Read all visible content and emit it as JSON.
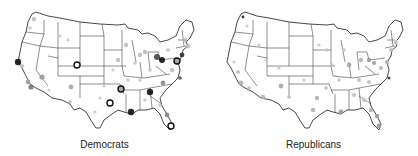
{
  "figure": {
    "panels": [
      {
        "label": "Democrats",
        "markers": [
          {
            "x": 34,
            "y": 19,
            "r": 2.2,
            "c": "#bdbdbd"
          },
          {
            "x": 30,
            "y": 28,
            "r": 1.8,
            "c": "#c8c8c8"
          },
          {
            "x": 18,
            "y": 62,
            "r": 3.2,
            "c": "#111111"
          },
          {
            "x": 22,
            "y": 66,
            "r": 2,
            "c": "#bdbdbd"
          },
          {
            "x": 28,
            "y": 82,
            "r": 2.4,
            "c": "#a0a0a0"
          },
          {
            "x": 31,
            "y": 87,
            "r": 2.6,
            "c": "#777777"
          },
          {
            "x": 42,
            "y": 77,
            "r": 2.6,
            "c": "#999999"
          },
          {
            "x": 49,
            "y": 90,
            "r": 1.6,
            "c": "#c8c8c8"
          },
          {
            "x": 60,
            "y": 36,
            "r": 1.6,
            "c": "#c8c8c8"
          },
          {
            "x": 68,
            "y": 40,
            "r": 1.6,
            "c": "#c8c8c8"
          },
          {
            "x": 77,
            "y": 65,
            "r": 3,
            "c": "ring"
          },
          {
            "x": 71,
            "y": 87,
            "r": 2.4,
            "c": "#a8a8a8"
          },
          {
            "x": 70,
            "y": 102,
            "r": 1.8,
            "c": "#bdbdbd"
          },
          {
            "x": 110,
            "y": 103,
            "r": 3,
            "c": "ring"
          },
          {
            "x": 100,
            "y": 98,
            "r": 1.6,
            "c": "#c8c8c8"
          },
          {
            "x": 121,
            "y": 89,
            "r": 3,
            "c": "ring-dark"
          },
          {
            "x": 131,
            "y": 112,
            "r": 3.2,
            "c": "#111111"
          },
          {
            "x": 150,
            "y": 92,
            "r": 3.2,
            "c": "#111111"
          },
          {
            "x": 163,
            "y": 83,
            "r": 2.4,
            "c": "#888888"
          },
          {
            "x": 167,
            "y": 115,
            "r": 2.4,
            "c": "#888888"
          },
          {
            "x": 171,
            "y": 126,
            "r": 3,
            "c": "ring"
          },
          {
            "x": 157,
            "y": 57,
            "r": 3,
            "c": "#444444"
          },
          {
            "x": 162,
            "y": 60,
            "r": 3,
            "c": "#111111"
          },
          {
            "x": 177,
            "y": 61,
            "r": 3,
            "c": "ring-dark"
          },
          {
            "x": 182,
            "y": 55,
            "r": 2.4,
            "c": "#333333"
          },
          {
            "x": 180,
            "y": 78,
            "r": 1.8,
            "c": "#555555"
          },
          {
            "x": 185,
            "y": 40,
            "r": 2.2,
            "c": "#bdbdbd"
          },
          {
            "x": 188,
            "y": 46,
            "r": 2.2,
            "c": "#bdbdbd"
          },
          {
            "x": 140,
            "y": 55,
            "r": 2.2,
            "c": "#bdbdbd"
          },
          {
            "x": 145,
            "y": 52,
            "r": 2.2,
            "c": "#bdbdbd"
          },
          {
            "x": 118,
            "y": 60,
            "r": 2.2,
            "c": "#bdbdbd"
          },
          {
            "x": 126,
            "y": 45,
            "r": 2.2,
            "c": "#bdbdbd"
          },
          {
            "x": 135,
            "y": 63,
            "r": 1.8,
            "c": "#c8c8c8"
          },
          {
            "x": 150,
            "y": 70,
            "r": 1.8,
            "c": "#c8c8c8"
          },
          {
            "x": 172,
            "y": 70,
            "r": 2.2,
            "c": "#bdbdbd"
          },
          {
            "x": 168,
            "y": 50,
            "r": 2,
            "c": "#c8c8c8"
          },
          {
            "x": 140,
            "y": 80,
            "r": 1.8,
            "c": "#c8c8c8"
          },
          {
            "x": 128,
            "y": 80,
            "r": 1.8,
            "c": "#c8c8c8"
          },
          {
            "x": 145,
            "y": 100,
            "r": 1.8,
            "c": "#c8c8c8"
          },
          {
            "x": 160,
            "y": 105,
            "r": 1.8,
            "c": "#c8c8c8"
          },
          {
            "x": 113,
            "y": 70,
            "r": 1.6,
            "c": "#c8c8c8"
          },
          {
            "x": 104,
            "y": 86,
            "r": 1.6,
            "c": "#c8c8c8"
          },
          {
            "x": 95,
            "y": 112,
            "r": 1.6,
            "c": "#c8c8c8"
          }
        ]
      },
      {
        "label": "Republicans",
        "markers": [
          {
            "x": 34,
            "y": 17,
            "r": 1.4,
            "c": "#222222"
          },
          {
            "x": 38,
            "y": 26,
            "r": 1.6,
            "c": "#c8c8c8"
          },
          {
            "x": 25,
            "y": 62,
            "r": 1.6,
            "c": "#c8c8c8"
          },
          {
            "x": 29,
            "y": 72,
            "r": 2,
            "c": "#bdbdbd"
          },
          {
            "x": 32,
            "y": 83,
            "r": 2.4,
            "c": "#b0b0b0"
          },
          {
            "x": 40,
            "y": 88,
            "r": 1.8,
            "c": "#bdbdbd"
          },
          {
            "x": 50,
            "y": 45,
            "r": 1.6,
            "c": "#c8c8c8"
          },
          {
            "x": 57,
            "y": 60,
            "r": 1.6,
            "c": "#c8c8c8"
          },
          {
            "x": 70,
            "y": 68,
            "r": 1.6,
            "c": "#c8c8c8"
          },
          {
            "x": 72,
            "y": 86,
            "r": 2.4,
            "c": "#a8a8a8"
          },
          {
            "x": 54,
            "y": 97,
            "r": 2.2,
            "c": "#b0b0b0"
          },
          {
            "x": 80,
            "y": 97,
            "r": 1.8,
            "c": "#bdbdbd"
          },
          {
            "x": 108,
            "y": 98,
            "r": 2.2,
            "c": "#b0b0b0"
          },
          {
            "x": 104,
            "y": 110,
            "r": 2.2,
            "c": "#b0b0b0"
          },
          {
            "x": 132,
            "y": 112,
            "r": 2.4,
            "c": "#999999"
          },
          {
            "x": 117,
            "y": 88,
            "r": 1.8,
            "c": "#bdbdbd"
          },
          {
            "x": 123,
            "y": 65,
            "r": 1.8,
            "c": "#c8c8c8"
          },
          {
            "x": 118,
            "y": 50,
            "r": 1.8,
            "c": "#c8c8c8"
          },
          {
            "x": 140,
            "y": 65,
            "r": 2.4,
            "c": "#a8a8a8"
          },
          {
            "x": 152,
            "y": 60,
            "r": 2.2,
            "c": "#b0b0b0"
          },
          {
            "x": 160,
            "y": 60,
            "r": 2.2,
            "c": "#999999"
          },
          {
            "x": 165,
            "y": 63,
            "r": 2,
            "c": "#999999"
          },
          {
            "x": 172,
            "y": 68,
            "r": 2,
            "c": "#b0b0b0"
          },
          {
            "x": 178,
            "y": 62,
            "r": 2.2,
            "c": "#b0b0b0"
          },
          {
            "x": 182,
            "y": 50,
            "r": 2,
            "c": "#bdbdbd"
          },
          {
            "x": 187,
            "y": 42,
            "r": 2,
            "c": "#c8c8c8"
          },
          {
            "x": 150,
            "y": 80,
            "r": 2,
            "c": "#bdbdbd"
          },
          {
            "x": 160,
            "y": 82,
            "r": 2,
            "c": "#bdbdbd"
          },
          {
            "x": 145,
            "y": 95,
            "r": 2,
            "c": "#bdbdbd"
          },
          {
            "x": 155,
            "y": 100,
            "r": 2,
            "c": "#bdbdbd"
          },
          {
            "x": 162,
            "y": 110,
            "r": 2.2,
            "c": "#b0b0b0"
          },
          {
            "x": 168,
            "y": 116,
            "r": 2.2,
            "c": "#999999"
          },
          {
            "x": 170,
            "y": 126,
            "r": 2.4,
            "c": "#999999"
          },
          {
            "x": 180,
            "y": 78,
            "r": 1.6,
            "c": "#444444"
          },
          {
            "x": 135,
            "y": 50,
            "r": 1.8,
            "c": "#c8c8c8"
          },
          {
            "x": 130,
            "y": 80,
            "r": 1.8,
            "c": "#c8c8c8"
          },
          {
            "x": 95,
            "y": 80,
            "r": 1.6,
            "c": "#c8c8c8"
          },
          {
            "x": 110,
            "y": 45,
            "r": 1.6,
            "c": "#c8c8c8"
          }
        ]
      }
    ]
  }
}
